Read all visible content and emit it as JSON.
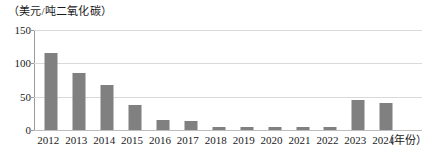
{
  "chart_data": {
    "type": "bar",
    "title": "",
    "subtitle": "",
    "xlabel": "（年份）",
    "ylabel": "（美元/吨二氧化碳）",
    "categories": [
      "2012",
      "2013",
      "2014",
      "2015",
      "2016",
      "2017",
      "2018",
      "2019",
      "2020",
      "2021",
      "2022",
      "2023",
      "2024"
    ],
    "values": [
      115,
      86,
      67,
      38,
      15,
      14,
      5,
      5,
      5,
      5,
      5,
      45,
      40
    ],
    "ylim": [
      0,
      150
    ],
    "yticks": [
      0,
      50,
      100,
      150
    ],
    "ytick_labels": [
      "0",
      "50",
      "100",
      "150"
    ],
    "grid": "horizontal",
    "legend": "none",
    "series_color": "#808080",
    "gridline_color": "#d9d9d9",
    "axis_color": "#9a9a9a",
    "background": "#ffffff"
  }
}
